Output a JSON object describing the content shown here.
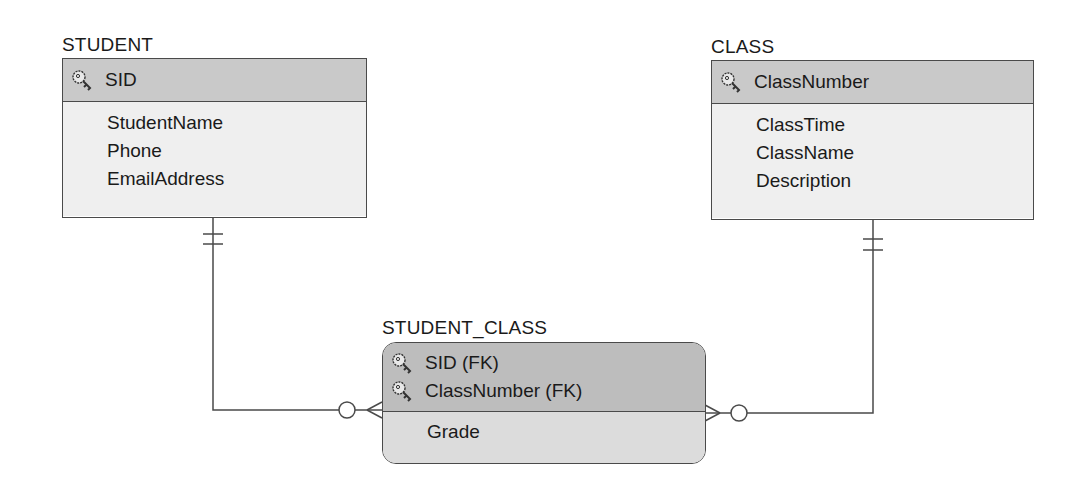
{
  "diagram": {
    "type": "IE crow's foot ER diagram",
    "entities": [
      {
        "name": "STUDENT",
        "kind": "strong",
        "keys": [
          {
            "label": "SID",
            "icon": "key-icon"
          }
        ],
        "attributes": [
          "StudentName",
          "Phone",
          "EmailAddress"
        ]
      },
      {
        "name": "CLASS",
        "kind": "strong",
        "keys": [
          {
            "label": "ClassNumber",
            "icon": "key-icon"
          }
        ],
        "attributes": [
          "ClassTime",
          "ClassName",
          "Description"
        ]
      },
      {
        "name": "STUDENT_CLASS",
        "kind": "dependent",
        "keys": [
          {
            "label": "SID (FK)",
            "icon": "key-icon"
          },
          {
            "label": "ClassNumber (FK)",
            "icon": "key-icon"
          }
        ],
        "attributes": [
          "Grade"
        ]
      }
    ],
    "relationships": [
      {
        "from": "STUDENT",
        "from_card": "mandatory-one",
        "to": "STUDENT_CLASS",
        "to_card": "optional-many"
      },
      {
        "from": "CLASS",
        "from_card": "mandatory-one",
        "to": "STUDENT_CLASS",
        "to_card": "optional-many"
      }
    ],
    "colors": {
      "line": "#4a4a4a",
      "header_fill": "#c9c9c9",
      "body_fill": "#efefef",
      "dep_header_fill": "#bdbdbd",
      "dep_body_fill": "#dcdcdc"
    }
  }
}
